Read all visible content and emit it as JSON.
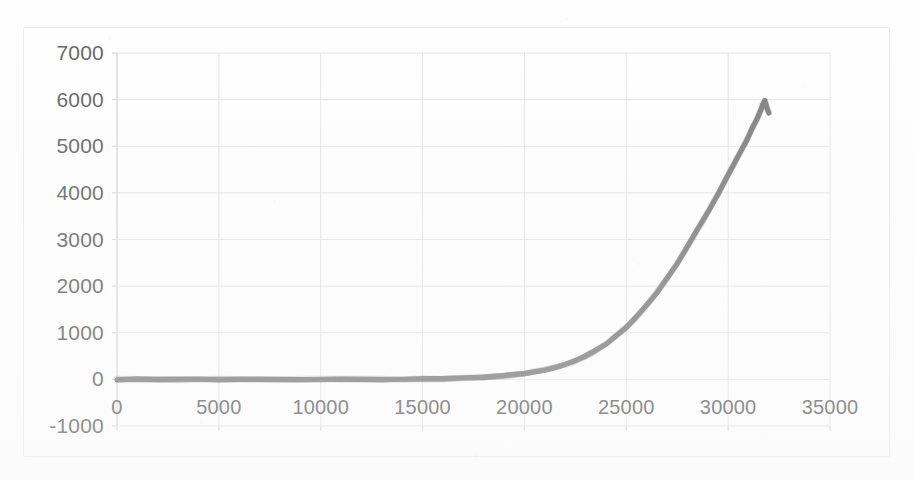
{
  "chart_data": {
    "type": "line",
    "title": "",
    "subtitle": "",
    "xlabel": "",
    "ylabel": "",
    "xlim": [
      0,
      35000
    ],
    "ylim": [
      -1000,
      7000
    ],
    "grid": true,
    "legend": null,
    "legend_position": "none",
    "series_color": "#7d7d7d",
    "gridline_color": "#e3e3e3",
    "axis_color": "#d9d9d9",
    "tick_label_color": "#636363",
    "y_ticks": [
      7000,
      6000,
      5000,
      4000,
      3000,
      2000,
      1000,
      0,
      -1000
    ],
    "y_tick_labels": [
      "7000",
      "6000",
      "5000",
      "4000",
      "3000",
      "2000",
      "1000",
      "0",
      "-1000"
    ],
    "x_ticks": [
      0,
      5000,
      10000,
      15000,
      20000,
      25000,
      30000,
      35000
    ],
    "x_tick_labels": [
      "0",
      "5000",
      "10000",
      "15000",
      "20000",
      "25000",
      "30000",
      "35000"
    ],
    "series": [
      {
        "name": "series1",
        "x": [
          0,
          1000,
          2000,
          3000,
          4000,
          5000,
          6000,
          7000,
          8000,
          9000,
          10000,
          11000,
          12000,
          13000,
          14000,
          15000,
          16000,
          17000,
          18000,
          19000,
          20000,
          20500,
          21000,
          21500,
          22000,
          22500,
          23000,
          23500,
          24000,
          24500,
          25000,
          25500,
          26000,
          26500,
          27000,
          27500,
          28000,
          28500,
          29000,
          29500,
          30000,
          30300,
          30600,
          30900,
          31200,
          31400,
          31600,
          31700,
          31800,
          31900,
          32000
        ],
        "values": [
          0,
          0,
          0,
          0,
          0,
          0,
          0,
          0,
          0,
          0,
          0,
          0,
          0,
          0,
          0,
          5,
          12,
          25,
          45,
          80,
          130,
          165,
          205,
          255,
          320,
          400,
          500,
          620,
          760,
          930,
          1120,
          1340,
          1590,
          1860,
          2160,
          2490,
          2840,
          3210,
          3590,
          3980,
          4380,
          4630,
          4880,
          5130,
          5400,
          5580,
          5780,
          5900,
          5980,
          5800,
          5720
        ]
      }
    ],
    "annotations": []
  },
  "accents": {
    "frame_border": "#ececec",
    "page_background": "#fefefe"
  }
}
